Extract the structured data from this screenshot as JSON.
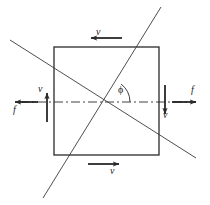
{
  "figure": {
    "type": "mechanics-free-body-diagram",
    "background_color": "#ffffff",
    "line_color": "#2a2a2a",
    "square": {
      "left": 54,
      "top": 47,
      "right": 159,
      "bottom": 155,
      "stroke_width": 1.2
    },
    "centerline": {
      "name": "horizontal-dash-dot-axis",
      "y": 102,
      "x_start": 20,
      "x_end": 196,
      "dash_pattern": "9 3 2 3"
    },
    "diagonals": [
      {
        "name": "descending-diagonal",
        "x1": 10,
        "y1": 40,
        "x2": 196,
        "y2": 158
      },
      {
        "name": "ascending-steep-diagonal",
        "x1": 43,
        "y1": 198,
        "x2": 161,
        "y2": 7
      }
    ],
    "angle": {
      "name": "phi-angle",
      "label": "ϕ",
      "vertex_x": 107,
      "vertex_y": 102,
      "arc_radius": 23
    },
    "vectors": [
      {
        "id": "v-top",
        "label": "v",
        "quantity": "velocity",
        "direction": "left",
        "x1": 122,
        "y1": 38,
        "x2": 90,
        "y2": 38,
        "label_x": 96,
        "label_y": 27
      },
      {
        "id": "v-left",
        "label": "v",
        "quantity": "velocity",
        "direction": "up",
        "x1": 47,
        "y1": 122,
        "x2": 47,
        "y2": 92,
        "label_x": 38,
        "label_y": 84
      },
      {
        "id": "f-left",
        "label": "f",
        "quantity": "friction-force",
        "direction": "left",
        "x1": 38,
        "y1": 102,
        "x2": 14,
        "y2": 102,
        "label_x": 13,
        "label_y": 105
      },
      {
        "id": "v-right",
        "label": "v",
        "quantity": "velocity",
        "direction": "down",
        "x1": 165,
        "y1": 85,
        "x2": 165,
        "y2": 115,
        "label_x": 163,
        "label_y": 110
      },
      {
        "id": "f-right",
        "label": "f",
        "quantity": "friction-force",
        "direction": "right",
        "x1": 172,
        "y1": 102,
        "x2": 197,
        "y2": 102,
        "label_x": 191,
        "label_y": 85
      },
      {
        "id": "v-bottom",
        "label": "v",
        "quantity": "velocity",
        "direction": "right",
        "x1": 88,
        "y1": 164,
        "x2": 120,
        "y2": 164,
        "label_x": 110,
        "label_y": 166
      }
    ]
  },
  "labels": {
    "v_top": "v",
    "v_left": "v",
    "f_left": "f",
    "v_right": "v",
    "f_right": "f",
    "v_bottom": "v",
    "phi": "ϕ"
  }
}
